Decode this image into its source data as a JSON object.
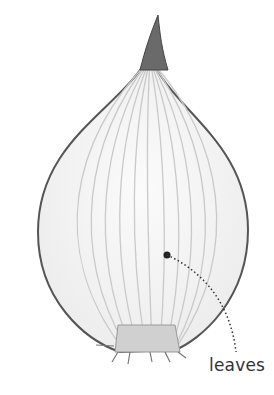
{
  "diagram": {
    "labels": [
      {
        "text": "leaves",
        "points_to": "onion-leaf-layers"
      }
    ],
    "colors": {
      "outline": "#555555",
      "layer_lines": "#c8c8c8",
      "fill": "#f6f6f6",
      "leader_line": "#333333",
      "label_text": "#333333"
    }
  }
}
